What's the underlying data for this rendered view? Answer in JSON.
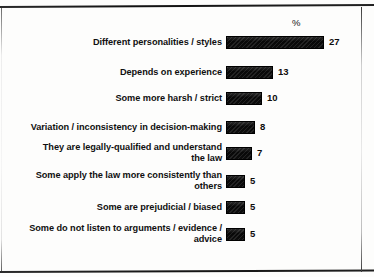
{
  "chart_data": {
    "type": "bar",
    "orientation": "horizontal",
    "title": "",
    "subtitle": "",
    "xlabel": "",
    "ylabel": "",
    "value_axis_header": "%",
    "grid": false,
    "legend": false,
    "axis_visible": false,
    "value_labels_shown": true,
    "xlim": [
      0,
      27
    ],
    "categories": [
      "Different personalities / styles",
      "Depends on experience",
      "Some more harsh / strict",
      "Variation / inconsistency in decision-making",
      "They are legally-qualified and understand the law",
      "Some apply the law more consistently than others",
      "Some are prejudicial / biased",
      "Some do not listen to arguments / evidence / advice"
    ],
    "values": [
      27,
      13,
      10,
      8,
      7,
      5,
      5,
      5
    ],
    "value_label_texts": [
      "27",
      "13",
      "10",
      "8",
      "7",
      "5",
      "5",
      "5"
    ],
    "bar_color": "#0d0d0d"
  },
  "rows": [
    {
      "label_lines": [
        "Different personalities / styles"
      ],
      "value": 27,
      "value_text": "27",
      "top": 36,
      "label_top": 37,
      "bar_px": 98
    },
    {
      "label_lines": [
        "Depends on experience"
      ],
      "value": 13,
      "value_text": "13",
      "top": 66,
      "label_top": 67,
      "bar_px": 47
    },
    {
      "label_lines": [
        "Some more harsh / strict"
      ],
      "value": 10,
      "value_text": "10",
      "top": 92,
      "label_top": 93,
      "bar_px": 36
    },
    {
      "label_lines": [
        "Variation / inconsistency in decision-making"
      ],
      "value": 8,
      "value_text": "8",
      "top": 121,
      "label_top": 122,
      "bar_px": 29
    },
    {
      "label_lines": [
        "They are legally-qualified and understand",
        "the law"
      ],
      "value": 7,
      "value_text": "7",
      "top": 147,
      "label_top": 142,
      "bar_px": 26
    },
    {
      "label_lines": [
        "Some apply the law more consistently than",
        "others"
      ],
      "value": 5,
      "value_text": "5",
      "top": 175,
      "label_top": 170,
      "bar_px": 19
    },
    {
      "label_lines": [
        "Some are prejudicial / biased"
      ],
      "value": 5,
      "value_text": "5",
      "top": 201,
      "label_top": 202,
      "bar_px": 19
    },
    {
      "label_lines": [
        "Some do not listen to arguments / evidence /",
        "advice"
      ],
      "value": 5,
      "value_text": "5",
      "top": 228,
      "label_top": 223,
      "bar_px": 19
    }
  ],
  "header": {
    "percent_symbol": "%"
  }
}
